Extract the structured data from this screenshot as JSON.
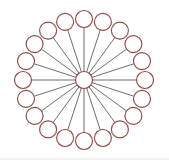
{
  "figure": {
    "type": "node-link-diagram",
    "width": 169,
    "height": 160,
    "background_color": "#ffffff"
  },
  "chart_data": {
    "type": "scatter",
    "xlabel": "",
    "ylabel": "",
    "layout": "radial",
    "grid": false,
    "legend": null,
    "center": {
      "x": 84,
      "y": 80
    },
    "ring_radius": 61,
    "leaf_count": 20,
    "angle_step_degrees": 18,
    "start_angle_degrees": -90,
    "hub": {
      "label": "hub",
      "x": 84,
      "y": 80,
      "radius": 8.5,
      "stroke": "#8c4a46",
      "fill": "#ffffff"
    },
    "node_radius": 8.5,
    "node_stroke": "#8c4a46",
    "node_fill": "#ffffff",
    "edge_stroke": "#4a4a4a",
    "edge_width": 0.8,
    "nodes": [
      {
        "id": "n1",
        "angle": -90,
        "x": 84.0,
        "y": 19.0
      },
      {
        "id": "n2",
        "angle": -72,
        "x": 102.9,
        "y": 21.9
      },
      {
        "id": "n3",
        "angle": -54,
        "x": 119.9,
        "y": 30.6
      },
      {
        "id": "n4",
        "angle": -36,
        "x": 133.4,
        "y": 44.1
      },
      {
        "id": "n5",
        "angle": -18,
        "x": 142.0,
        "y": 61.1
      },
      {
        "id": "n6",
        "angle": 0,
        "x": 145.0,
        "y": 80.0
      },
      {
        "id": "n7",
        "angle": 18,
        "x": 142.0,
        "y": 98.9
      },
      {
        "id": "n8",
        "angle": 36,
        "x": 133.4,
        "y": 115.9
      },
      {
        "id": "n9",
        "angle": 54,
        "x": 119.9,
        "y": 129.4
      },
      {
        "id": "n10",
        "angle": 72,
        "x": 102.9,
        "y": 138.0
      },
      {
        "id": "n11",
        "angle": 90,
        "x": 84.0,
        "y": 141.0
      },
      {
        "id": "n12",
        "angle": 108,
        "x": 65.1,
        "y": 138.0
      },
      {
        "id": "n13",
        "angle": 126,
        "x": 48.1,
        "y": 129.4
      },
      {
        "id": "n14",
        "angle": 144,
        "x": 34.6,
        "y": 115.9
      },
      {
        "id": "n15",
        "angle": 162,
        "x": 26.0,
        "y": 98.9
      },
      {
        "id": "n16",
        "angle": 180,
        "x": 23.0,
        "y": 80.0
      },
      {
        "id": "n17",
        "angle": 198,
        "x": 26.0,
        "y": 61.1
      },
      {
        "id": "n18",
        "angle": 216,
        "x": 34.6,
        "y": 44.1
      },
      {
        "id": "n19",
        "angle": 234,
        "x": 48.1,
        "y": 30.6
      },
      {
        "id": "n20",
        "angle": 252,
        "x": 65.1,
        "y": 21.9
      }
    ],
    "edges": [
      {
        "from": "hub",
        "to": "n1"
      },
      {
        "from": "hub",
        "to": "n2"
      },
      {
        "from": "hub",
        "to": "n3"
      },
      {
        "from": "hub",
        "to": "n4"
      },
      {
        "from": "hub",
        "to": "n5"
      },
      {
        "from": "hub",
        "to": "n6"
      },
      {
        "from": "hub",
        "to": "n7"
      },
      {
        "from": "hub",
        "to": "n8"
      },
      {
        "from": "hub",
        "to": "n9"
      },
      {
        "from": "hub",
        "to": "n10"
      },
      {
        "from": "hub",
        "to": "n11"
      },
      {
        "from": "hub",
        "to": "n12"
      },
      {
        "from": "hub",
        "to": "n13"
      },
      {
        "from": "hub",
        "to": "n14"
      },
      {
        "from": "hub",
        "to": "n15"
      },
      {
        "from": "hub",
        "to": "n16"
      },
      {
        "from": "hub",
        "to": "n17"
      },
      {
        "from": "hub",
        "to": "n18"
      },
      {
        "from": "hub",
        "to": "n19"
      },
      {
        "from": "hub",
        "to": "n20"
      }
    ]
  }
}
